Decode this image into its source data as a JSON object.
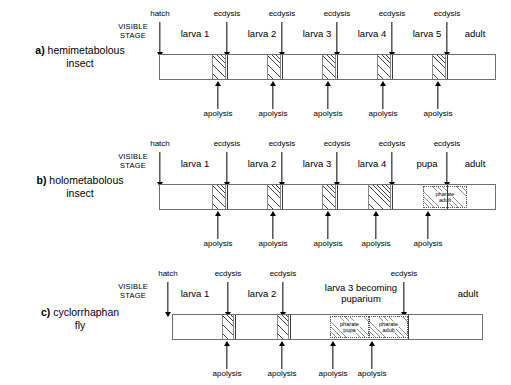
{
  "figure": {
    "visible_stage_label_line1": "VISIBLE",
    "visible_stage_label_line2": "STAGE",
    "event_hatch": "hatch",
    "event_ecdysis": "ecdysis",
    "event_apolysis": "apolysis",
    "colors": {
      "bar_border": "#6e6e6e",
      "divider": "#3a3a3a",
      "hatch_ink": "#3f3f3f",
      "background": "#ffffff",
      "text": "#000000"
    }
  },
  "panels": [
    {
      "id": "a",
      "index_label": "a)",
      "title_line1": "hemimetabolous",
      "title_line2": "insect",
      "stages": [
        {
          "label": "larva 1"
        },
        {
          "label": "larva 2"
        },
        {
          "label": "larva 3"
        },
        {
          "label": "larva 4"
        },
        {
          "label": "larva 5"
        },
        {
          "label": "adult"
        }
      ],
      "top_events": [
        {
          "label": "hatch"
        },
        {
          "label": "ecdysis"
        },
        {
          "label": "ecdysis"
        },
        {
          "label": "ecdysis"
        },
        {
          "label": "ecdysis"
        },
        {
          "label": "ecdysis"
        }
      ],
      "bottom_events": [
        {
          "label": "apolysis"
        },
        {
          "label": "apolysis"
        },
        {
          "label": "apolysis"
        },
        {
          "label": "apolysis"
        },
        {
          "label": "apolysis"
        }
      ],
      "pharate_boxes": []
    },
    {
      "id": "b",
      "index_label": "b)",
      "title_line1": "holometabolous",
      "title_line2": "insect",
      "stages": [
        {
          "label": "larva 1"
        },
        {
          "label": "larva 2"
        },
        {
          "label": "larva 3"
        },
        {
          "label": "larva 4"
        },
        {
          "label": "pupa"
        },
        {
          "label": "adult"
        }
      ],
      "top_events": [
        {
          "label": "hatch"
        },
        {
          "label": "ecdysis"
        },
        {
          "label": "ecdysis"
        },
        {
          "label": "ecdysis"
        },
        {
          "label": "ecdysis"
        },
        {
          "label": "ecdysis"
        }
      ],
      "bottom_events": [
        {
          "label": "apolysis"
        },
        {
          "label": "apolysis"
        },
        {
          "label": "apolysis"
        },
        {
          "label": "apolysis"
        },
        {
          "label": "apolysis"
        }
      ],
      "pharate_boxes": [
        {
          "line1": "pharate",
          "line2": "adult"
        }
      ]
    },
    {
      "id": "c",
      "index_label": "c)",
      "title_line1": "cyclorrhaphan",
      "title_line2": "fly",
      "stages": [
        {
          "label": "larva 1"
        },
        {
          "label": "larva 2"
        },
        {
          "label": "larva 3 becoming"
        },
        {
          "label": "puparium"
        },
        {
          "label": "adult"
        }
      ],
      "top_events": [
        {
          "label": "hatch"
        },
        {
          "label": "ecdysis"
        },
        {
          "label": "ecdysis"
        },
        {
          "label": "ecdysis"
        }
      ],
      "bottom_events": [
        {
          "label": "apolysis"
        },
        {
          "label": "apolysis"
        },
        {
          "label": "apolysis"
        },
        {
          "label": "apolysis"
        }
      ],
      "pharate_boxes": [
        {
          "line1": "pharate",
          "line2": "pupa"
        },
        {
          "line1": "pharate",
          "line2": "adult"
        }
      ]
    }
  ]
}
